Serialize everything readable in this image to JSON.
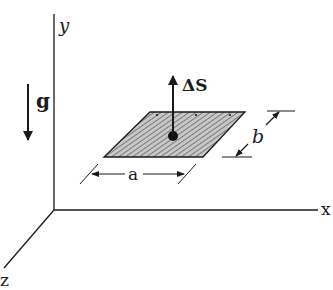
{
  "diagram": {
    "axes": {
      "x_label": "x",
      "y_label": "y",
      "z_label": "z"
    },
    "gravity": {
      "label": "g",
      "direction": "down"
    },
    "plate": {
      "dimension_a_label": "a",
      "dimension_b_label": "b",
      "normal_vector_label": "ΔS",
      "fill_pattern": "diagonal-hatch",
      "fill_color": "#bdbdbd"
    },
    "colors": {
      "line": "#1a1a1a",
      "background": "#ffffff"
    }
  }
}
